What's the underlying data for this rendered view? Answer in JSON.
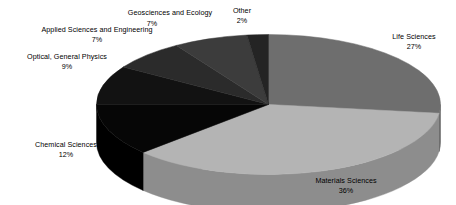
{
  "chart_data": {
    "type": "pie",
    "title": "",
    "subtitle": "",
    "xlabel": "",
    "ylabel": "",
    "legend_position": "none",
    "grid": false,
    "three_d": true,
    "start_angle_deg": 0,
    "direction": "clockwise",
    "categories": [
      "Life Sciences",
      "Materials Sciences",
      "Chemical Sciences",
      "Optical, General Physics",
      "Applied Sciences and Engineering",
      "Geosciences and Ecology",
      "Other"
    ],
    "values": [
      27,
      36,
      12,
      9,
      7,
      7,
      2
    ],
    "value_unit": "%",
    "total": 100,
    "slices": [
      {
        "name": "Life Sciences",
        "value": 27,
        "label": "Life Sciences",
        "percent_label": "27%",
        "color": "#6e6e6e",
        "side_color": "#555555"
      },
      {
        "name": "Materials Sciences",
        "value": 36,
        "label": "Materials Sciences",
        "percent_label": "36%",
        "color": "#b4b4b4",
        "side_color": "#8d8d8d"
      },
      {
        "name": "Chemical Sciences",
        "value": 12,
        "label": "Chemical Sciences",
        "percent_label": "12%",
        "color": "#060606",
        "side_color": "#000000"
      },
      {
        "name": "Optical, General Physics",
        "value": 9,
        "label": "Optical, General Physics",
        "percent_label": "9%",
        "color": "#121212",
        "side_color": "#000000"
      },
      {
        "name": "Applied Sciences and Engineering",
        "value": 7,
        "label": "Applied Sciences and Engineering",
        "percent_label": "7%",
        "color": "#2b2b2b",
        "side_color": "#111111"
      },
      {
        "name": "Geosciences and Ecology",
        "value": 7,
        "label": "Geosciences and Ecology",
        "percent_label": "7%",
        "color": "#3c3c3c",
        "side_color": "#1c1c1c"
      },
      {
        "name": "Other",
        "value": 2,
        "label": "Other",
        "percent_label": "2%",
        "color": "#242424",
        "side_color": "#0c0c0c"
      }
    ],
    "background_color": "#ffffff",
    "text_color": "#000000"
  }
}
